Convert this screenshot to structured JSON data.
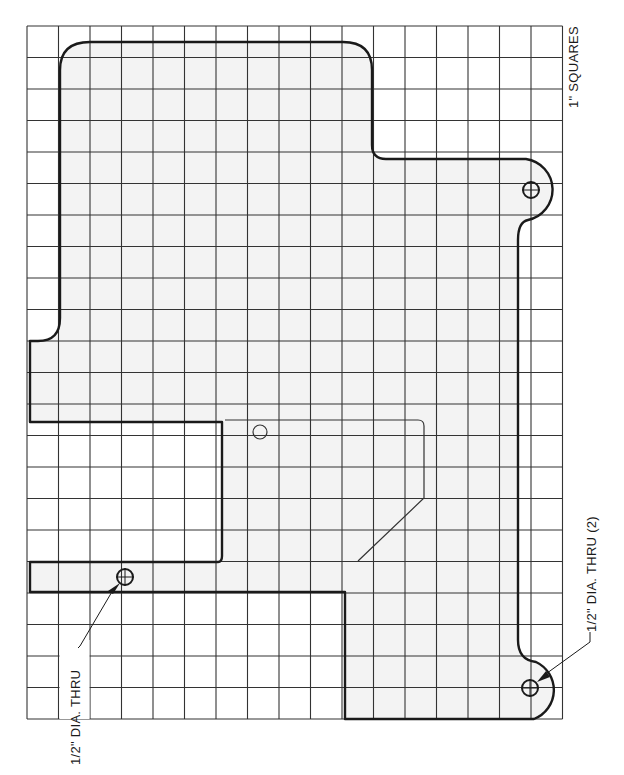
{
  "drawing": {
    "type": "pattern-template",
    "grid": {
      "origin_x": 27,
      "origin_y": 26,
      "cell": 31.5,
      "columns": 17,
      "rows": 22,
      "scale_label": "1\" SQUARES"
    },
    "colors": {
      "grid_line": "#333333",
      "outline": "#1a1a1a",
      "fill": "#f3f3f3",
      "background": "#ffffff"
    },
    "annotations": {
      "scale": "1\" SQUARES",
      "hole_single": "1/2\" DIA. THRU",
      "hole_double": "1/2\" DIA. THRU (2)"
    },
    "holes": [
      {
        "label": "hole-single",
        "cx": 125,
        "cy": 577,
        "r": 8
      },
      {
        "label": "hole-top-right",
        "cx": 530,
        "cy": 190,
        "r": 8
      },
      {
        "label": "hole-bottom-right",
        "cx": 530,
        "cy": 688,
        "r": 8
      },
      {
        "label": "locator-hole",
        "cx": 260,
        "cy": 432,
        "r": 7
      }
    ]
  }
}
